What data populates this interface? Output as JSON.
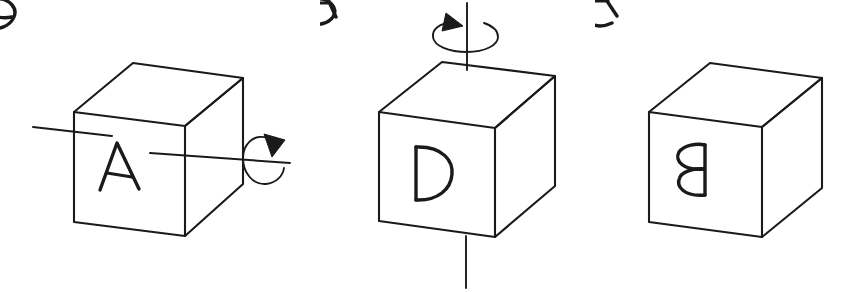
{
  "figure": {
    "background_color": "#ffffff",
    "ink_color": "#1a1a1a",
    "panel_count": 3
  },
  "panels": [
    {
      "id": "panel-1",
      "name": "cube-initial-state",
      "caption": "",
      "faces": {
        "front": {
          "label": "A",
          "orientation": "upright"
        },
        "top": {
          "label": "C",
          "orientation": "skewed-top-face"
        },
        "right": {
          "label": "B",
          "orientation": "skewed-right-face"
        }
      },
      "axis": {
        "name": "horizontal-rotation-axis",
        "direction": "horizontal",
        "arrow": {
          "name": "rotation-arrow-clockwise",
          "shape": "circular-loop",
          "head": "upper-right"
        }
      }
    },
    {
      "id": "panel-2",
      "name": "cube-after-first-rotation",
      "caption": "",
      "faces": {
        "front": {
          "label": "D",
          "orientation": "upright"
        },
        "top": {
          "label": "A",
          "orientation": "rotated-on-top-face"
        },
        "right": {
          "label": "B",
          "orientation": "upside-down"
        }
      },
      "axis": {
        "name": "vertical-rotation-axis",
        "direction": "vertical",
        "arrow": {
          "name": "rotation-arrow-counterclockwise",
          "shape": "ellipse-loop",
          "head": "upper-left"
        }
      }
    },
    {
      "id": "panel-3",
      "name": "cube-final-state",
      "caption": "",
      "faces": {
        "front": {
          "label": "B",
          "orientation": "upside-down"
        },
        "top": {
          "label": "A",
          "orientation": "upside-down-on-top-face"
        },
        "right": {
          "label": "C",
          "orientation": "mirrored"
        }
      },
      "axis": null
    }
  ]
}
